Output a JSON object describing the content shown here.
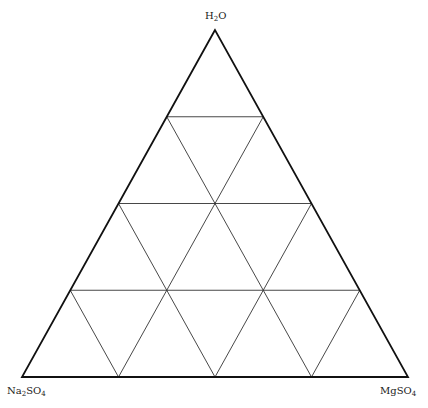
{
  "diagram": {
    "type": "ternary-grid",
    "divisions": 4,
    "vertices": {
      "top": {
        "label": "H2O",
        "parts": [
          [
            "H",
            ""
          ],
          [
            "2",
            "sub"
          ],
          [
            "O",
            ""
          ]
        ]
      },
      "left": {
        "label": "Na2SO4",
        "parts": [
          [
            "Na",
            ""
          ],
          [
            "2",
            "sub"
          ],
          [
            "SO",
            ""
          ],
          [
            "4",
            "sub"
          ]
        ]
      },
      "right": {
        "label": "MgSO4",
        "parts": [
          [
            "MgSO",
            ""
          ],
          [
            "4",
            "sub"
          ]
        ]
      }
    },
    "geometry": {
      "apex": [
        215,
        30
      ],
      "bottom_left": [
        22,
        377
      ],
      "bottom_right": [
        408,
        377
      ]
    },
    "colors": {
      "outline": "#111111",
      "grid": "#333333",
      "background": "#ffffff"
    }
  }
}
